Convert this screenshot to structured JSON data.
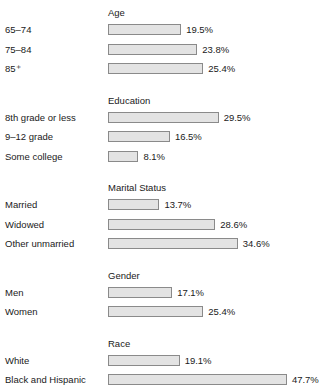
{
  "chart_data": {
    "type": "bar",
    "title": "",
    "subtitle": "",
    "xlabel": "",
    "ylabel": "",
    "orientation": "horizontal",
    "grid": false,
    "legend": "none",
    "xlim": [
      0,
      50
    ],
    "value_suffix": "%",
    "groups": [
      {
        "name": "Age",
        "categories": [
          "65–74",
          "75–84",
          "85⁺"
        ],
        "values": [
          19.5,
          23.8,
          25.4
        ],
        "labels": [
          "19.5%",
          "23.8%",
          "25.4%"
        ]
      },
      {
        "name": "Education",
        "categories": [
          "8th grade or less",
          "9–12 grade",
          "Some college"
        ],
        "values": [
          29.5,
          16.5,
          8.1
        ],
        "labels": [
          "29.5%",
          "16.5%",
          "8.1%"
        ]
      },
      {
        "name": "Marital Status",
        "categories": [
          "Married",
          "Widowed",
          "Other unmarried"
        ],
        "values": [
          13.7,
          28.6,
          34.6
        ],
        "labels": [
          "13.7%",
          "28.6%",
          "34.6%"
        ]
      },
      {
        "name": "Gender",
        "categories": [
          "Men",
          "Women"
        ],
        "values": [
          17.1,
          25.4
        ],
        "labels": [
          "17.1%",
          "25.4%"
        ]
      },
      {
        "name": "Race",
        "categories": [
          "White",
          "Black and Hispanic"
        ],
        "values": [
          19.1,
          47.7
        ],
        "labels": [
          "19.1%",
          "47.7%"
        ]
      }
    ]
  },
  "style": {
    "bar_fill": "#e3e3e3",
    "bar_border": "#8a8a8a",
    "text_color": "#1a1a1a",
    "background": "#ffffff"
  },
  "layout": {
    "bar_origin_x": 108,
    "px_per_percent": 3.75,
    "row_pitch": 19.5,
    "bar_height": 11,
    "group_header_gap": 14,
    "group_gap": 12,
    "first_header_y": 7
  }
}
